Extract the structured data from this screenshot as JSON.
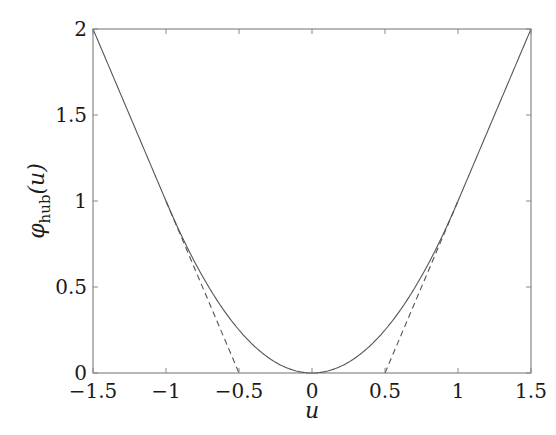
{
  "chart_data": {
    "type": "line",
    "title": "",
    "xlabel": "u",
    "ylabel": "φ_hub(u)",
    "ylabel_parts": {
      "symbol": "φ",
      "subscript": "hub",
      "arg": "(u)"
    },
    "xlim": [
      -1.5,
      1.5
    ],
    "ylim": [
      0,
      2
    ],
    "x_ticks": [
      -1.5,
      -1,
      -0.5,
      0,
      0.5,
      1,
      1.5
    ],
    "x_tick_labels": [
      "−1.5",
      "−1",
      "−0.5",
      "0",
      "0.5",
      "1",
      "1.5"
    ],
    "y_ticks": [
      0,
      0.5,
      1,
      1.5,
      2
    ],
    "y_tick_labels": [
      "0",
      "0.5",
      "1",
      "1.5",
      "2"
    ],
    "grid": false,
    "legend": null,
    "series": [
      {
        "name": "Huber penalty (M = 1)",
        "style": "solid",
        "color": "#555555",
        "definition": "u^2 for |u|<=1, 2|u|-1 for |u|>1",
        "x": [
          -1.5,
          -1.25,
          -1.0,
          -0.75,
          -0.5,
          -0.25,
          0,
          0.25,
          0.5,
          0.75,
          1.0,
          1.25,
          1.5
        ],
        "y": [
          2.0,
          1.5,
          1.0,
          0.5625,
          0.25,
          0.0625,
          0,
          0.0625,
          0.25,
          0.5625,
          1.0,
          1.5,
          2.0
        ]
      },
      {
        "name": "Linear extension (left)",
        "style": "dashed",
        "color": "#555555",
        "x": [
          -1.0,
          -0.5
        ],
        "y": [
          1.0,
          0
        ]
      },
      {
        "name": "Linear extension (right)",
        "style": "dashed",
        "color": "#555555",
        "x": [
          0.5,
          1.0
        ],
        "y": [
          0,
          1.0
        ]
      }
    ]
  }
}
